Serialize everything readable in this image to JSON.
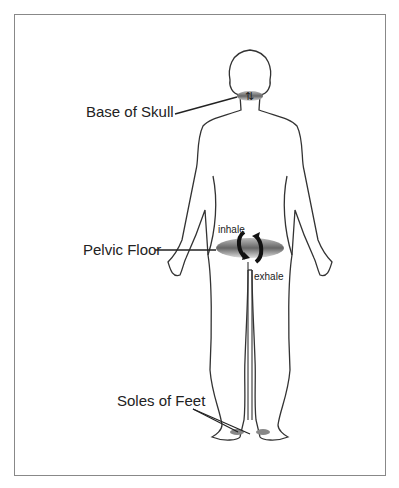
{
  "figure": {
    "labels": {
      "skull": "Base of Skull",
      "pelvic": "Pelvic Floor",
      "feet": "Soles of Feet",
      "inhale": "inhale",
      "exhale": "exhale"
    },
    "colors": {
      "outline": "#333333",
      "frame": "#888888",
      "disc": "#777777"
    }
  }
}
